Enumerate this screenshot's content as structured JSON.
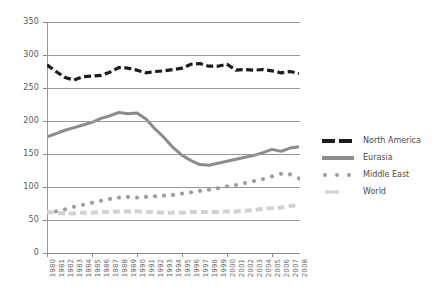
{
  "chart_data": {
    "type": "line",
    "title": "",
    "subtitle": "",
    "xlabel": "",
    "ylabel": "",
    "xlim": [
      1980,
      2008
    ],
    "ylim": [
      0,
      350
    ],
    "grid": true,
    "legend_position": "right",
    "yticks": [
      0,
      50,
      100,
      150,
      200,
      250,
      300,
      350
    ],
    "ytick_labels": [
      "0",
      "50",
      "100",
      "150",
      "200",
      "250",
      "300",
      "350"
    ],
    "categories": [
      "1980",
      "1981",
      "1982",
      "1983",
      "1984",
      "1985",
      "1986",
      "1987",
      "1988",
      "1989",
      "1990",
      "1991",
      "1992",
      "1993",
      "1994",
      "1995",
      "1996",
      "1997",
      "1998",
      "1999",
      "2000",
      "2001",
      "2002",
      "2003",
      "2004",
      "2005",
      "2006",
      "2007",
      "2008"
    ],
    "series": [
      {
        "name": "North America",
        "style": "dashed",
        "color": "#1c1c1c",
        "width": 3.2,
        "values": [
          285,
          275,
          266,
          262,
          267,
          268,
          269,
          274,
          281,
          280,
          277,
          273,
          275,
          276,
          278,
          280,
          286,
          287,
          283,
          283,
          286,
          277,
          278,
          277,
          278,
          276,
          273,
          275,
          272
        ]
      },
      {
        "name": "Eurasia",
        "style": "solid",
        "color": "#8c8c8c",
        "width": 3.0,
        "values": [
          176,
          181,
          186,
          190,
          194,
          198,
          204,
          208,
          213,
          211,
          212,
          203,
          188,
          175,
          160,
          148,
          140,
          134,
          133,
          136,
          139,
          142,
          145,
          148,
          152,
          157,
          154,
          159,
          161
        ]
      },
      {
        "name": "Middle East",
        "style": "dotted",
        "color": "#9e9e9e",
        "width": 4.2,
        "values": [
          61,
          63,
          66,
          70,
          73,
          76,
          79,
          82,
          84,
          85,
          84,
          85,
          86,
          87,
          88,
          90,
          92,
          94,
          96,
          98,
          101,
          103,
          106,
          109,
          112,
          116,
          120,
          119,
          113
        ]
      },
      {
        "name": "World",
        "style": "dashed-light",
        "color": "#d2d2d2",
        "width": 4.0,
        "values": [
          62,
          61,
          60,
          60,
          61,
          61,
          62,
          62,
          63,
          63,
          63,
          62,
          62,
          61,
          61,
          61,
          62,
          62,
          62,
          62,
          63,
          63,
          64,
          65,
          67,
          68,
          69,
          71,
          73
        ]
      }
    ]
  },
  "legend": {
    "items": [
      {
        "label": "North America",
        "style": "dashed",
        "color": "#1c1c1c"
      },
      {
        "label": "Eurasia",
        "style": "solid",
        "color": "#8c8c8c"
      },
      {
        "label": "Middle East",
        "style": "dotted",
        "color": "#9e9e9e"
      },
      {
        "label": "World",
        "style": "dashed-light",
        "color": "#d2d2d2"
      }
    ]
  }
}
